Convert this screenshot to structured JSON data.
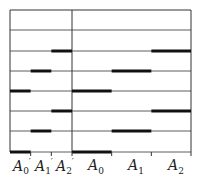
{
  "diagram": {
    "type": "sequence-timing-diagram",
    "sections": [
      {
        "name": "left",
        "x0": 10,
        "x1": 72,
        "segments": [
          "A0'",
          "A1'",
          "A2'"
        ]
      },
      {
        "name": "right",
        "x0": 72,
        "x1": 191,
        "segments": [
          "A0",
          "A1",
          "A2"
        ]
      }
    ],
    "row_y": [
      30,
      51,
      71,
      91,
      111,
      131,
      152
    ],
    "rows": [
      {
        "active": null
      },
      {
        "active": 2
      },
      {
        "active": 1
      },
      {
        "active": 0
      },
      {
        "active": 2
      },
      {
        "active": 1
      },
      {
        "active": 0
      }
    ],
    "labels": {
      "left": [
        {
          "base": "A",
          "sub": "0",
          "prime": "′"
        },
        {
          "base": "A",
          "sub": "1",
          "prime": "′"
        },
        {
          "base": "A",
          "sub": "2",
          "prime": "′"
        }
      ],
      "right": [
        {
          "base": "A",
          "sub": "0",
          "prime": ""
        },
        {
          "base": "A",
          "sub": "1",
          "prime": ""
        },
        {
          "base": "A",
          "sub": "2",
          "prime": ""
        }
      ]
    },
    "colors": {
      "line": "#333333",
      "bar": "#111111"
    }
  }
}
